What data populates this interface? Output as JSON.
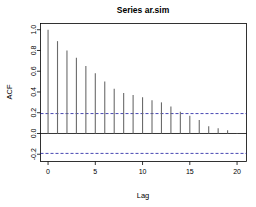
{
  "chart_data": {
    "type": "bar",
    "title": "Series  ar.sim",
    "xlabel": "Lag",
    "ylabel": "ACF",
    "x": [
      0,
      1,
      2,
      3,
      4,
      5,
      6,
      7,
      8,
      9,
      10,
      11,
      12,
      13,
      14,
      15,
      16,
      17,
      18,
      19,
      20
    ],
    "categories": [
      "0",
      "1",
      "2",
      "3",
      "4",
      "5",
      "6",
      "7",
      "8",
      "9",
      "10",
      "11",
      "12",
      "13",
      "14",
      "15",
      "16",
      "17",
      "18",
      "19",
      "20"
    ],
    "values": [
      1.0,
      0.89,
      0.8,
      0.73,
      0.65,
      0.58,
      0.5,
      0.43,
      0.39,
      0.37,
      0.35,
      0.32,
      0.3,
      0.26,
      0.21,
      0.17,
      0.13,
      0.07,
      0.05,
      0.03,
      0.005
    ],
    "xlim": [
      -0.8,
      21.0
    ],
    "ylim": [
      -0.27,
      1.06
    ],
    "xticks": [
      0,
      5,
      10,
      15,
      20
    ],
    "xticklabels": [
      "0",
      "5",
      "10",
      "15",
      "20"
    ],
    "yticks": [
      -0.2,
      0.0,
      0.2,
      0.4,
      0.6,
      0.8,
      1.0
    ],
    "yticklabels": [
      "-0.2",
      "0.0",
      "0.2",
      "0.4",
      "0.6",
      "0.8",
      "1.0"
    ],
    "zero_line": 0.0,
    "confidence_bands": [
      0.192,
      -0.192
    ],
    "grid": false,
    "legend": "none",
    "bar_color": "#6b6b6b",
    "conf_color": "#1a1aa0",
    "axis_color": "#000000"
  },
  "labels": {
    "title": "Series  ar.sim",
    "x_axis_title": "Lag",
    "y_axis_title": "ACF"
  }
}
